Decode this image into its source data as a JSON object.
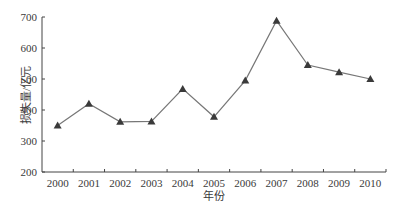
{
  "chart_data": {
    "type": "line",
    "title": "",
    "xlabel": "年份",
    "ylabel": "损失量/亿元",
    "categories": [
      "2000",
      "2001",
      "2002",
      "2003",
      "2004",
      "2005",
      "2006",
      "2007",
      "2008",
      "2009",
      "2010"
    ],
    "series": [
      {
        "name": "损失量",
        "values": [
          350,
          420,
          362,
          363,
          468,
          378,
          495,
          688,
          545,
          522,
          500
        ],
        "marker": "triangle",
        "color": "#555555"
      }
    ],
    "ylim": [
      200,
      700
    ],
    "yticks": [
      200,
      300,
      400,
      500,
      600,
      700
    ],
    "grid": false,
    "legend": null
  },
  "colors": {
    "axis": "#444444",
    "line": "#777777",
    "marker": "#3a3a3a",
    "text": "#3a3a3a"
  }
}
